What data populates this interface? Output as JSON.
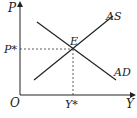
{
  "diagram": {
    "type": "AD-AS equilibrium",
    "axes": {
      "y_label": "P",
      "x_label": "Y",
      "origin_label": "O"
    },
    "curves": [
      {
        "name": "AS",
        "label": "AS",
        "slope": "upward"
      },
      {
        "name": "AD",
        "label": "AD",
        "slope": "downward"
      }
    ],
    "equilibrium": {
      "label": "E",
      "price_label": "P*",
      "output_label": "Y*"
    }
  }
}
